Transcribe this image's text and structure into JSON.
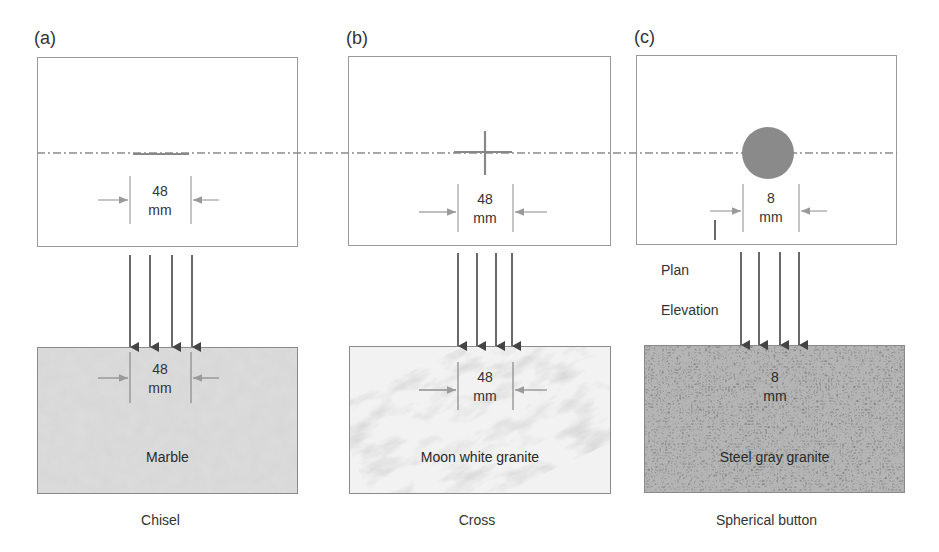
{
  "figure": {
    "panels": [
      {
        "id": "a",
        "label": "(a)",
        "tool_shape": "chisel",
        "plan_dimension": {
          "value": "48",
          "unit": "mm"
        },
        "elevation_dimension": {
          "value": "48",
          "unit": "mm"
        },
        "stone": "Marble",
        "caption": "Chisel"
      },
      {
        "id": "b",
        "label": "(b)",
        "tool_shape": "cross",
        "plan_dimension": {
          "value": "48",
          "unit": "mm"
        },
        "elevation_dimension": {
          "value": "48",
          "unit": "mm"
        },
        "stone": "Moon white granite",
        "caption": "Cross"
      },
      {
        "id": "c",
        "label": "(c)",
        "tool_shape": "circle",
        "plan_dimension": {
          "value": "8",
          "unit": "mm"
        },
        "elevation_dimension": {
          "value": "8",
          "unit": "mm"
        },
        "stone": "Steel gray granite",
        "caption": "Spherical button"
      }
    ],
    "view_labels": {
      "plan": "Plan",
      "elevation": "Elevation"
    },
    "colors": {
      "line": "#9a9a9a",
      "arrow": "#555555",
      "marble": "#d2d2d2",
      "moon_white": "#efefef",
      "steel_gray": "#8e8e8e",
      "button_fill": "#8a8a8a"
    }
  }
}
